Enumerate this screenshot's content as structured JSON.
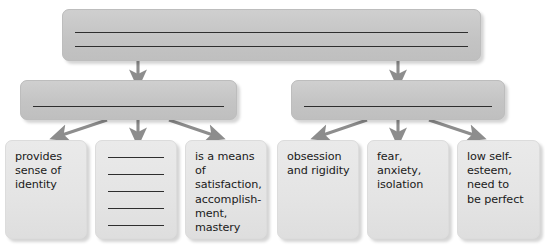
{
  "diagram": {
    "kind": "graphic-organizer",
    "title": "",
    "colors": {
      "box_fill_dark": "#c6c6c6",
      "box_fill_light": "#e6e6e6",
      "arrow": "#8d8d8d",
      "rule_line": "#2e2e2e",
      "text": "#1a1a1a",
      "background": "#ffffff"
    },
    "levels": {
      "top": {
        "label": "",
        "blank_lines": 2
      },
      "middle": [
        {
          "label": "",
          "blank_lines": 1
        },
        {
          "label": "",
          "blank_lines": 1
        }
      ],
      "bottom": [
        {
          "label": "provides\nsense of\nidentity",
          "blank_lines": 0
        },
        {
          "label": "",
          "blank_lines": 5
        },
        {
          "label": "is a means of\nsatisfaction,\naccomplish-\nment,\nmastery",
          "blank_lines": 0
        },
        {
          "label": "obsession\nand rigidity",
          "blank_lines": 0
        },
        {
          "label": "fear,\nanxiety,\nisolation",
          "blank_lines": 0
        },
        {
          "label": "low self-\nesteem,\nneed to\nbe perfect",
          "blank_lines": 0
        }
      ]
    },
    "connectors": [
      {
        "name": "top-to-middle-left",
        "from": "top",
        "to": "middle-1"
      },
      {
        "name": "top-to-middle-right",
        "from": "top",
        "to": "middle-2"
      },
      {
        "name": "middle-left-to-bottom-1",
        "from": "middle-1",
        "to": "bottom-1"
      },
      {
        "name": "middle-left-to-bottom-2",
        "from": "middle-1",
        "to": "bottom-2"
      },
      {
        "name": "middle-left-to-bottom-3",
        "from": "middle-1",
        "to": "bottom-3"
      },
      {
        "name": "middle-right-to-bottom-4",
        "from": "middle-2",
        "to": "bottom-4"
      },
      {
        "name": "middle-right-to-bottom-5",
        "from": "middle-2",
        "to": "bottom-5"
      },
      {
        "name": "middle-right-to-bottom-6",
        "from": "middle-2",
        "to": "bottom-6"
      }
    ]
  }
}
